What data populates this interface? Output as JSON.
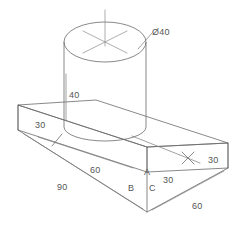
{
  "drawing": {
    "type": "isometric-technical-drawing",
    "subject": "rectangular base plate with cylindrical boss",
    "background_color": "#ffffff",
    "line_color": "#6b6b6b",
    "text_color": "#555555",
    "dimensions": [
      {
        "id": "diameter",
        "label": "Ø40",
        "value": 40,
        "symbol": "Ø",
        "x": 152,
        "y": 35,
        "anchor": "start",
        "describes": "cylinder diameter"
      },
      {
        "id": "cyl-height",
        "label": "40",
        "value": 40,
        "x": 69,
        "y": 98,
        "anchor": "start",
        "describes": "cylinder height"
      },
      {
        "id": "plate-thickness-left",
        "label": "30",
        "value": 30,
        "x": 35,
        "y": 128,
        "anchor": "start",
        "describes": "plate thickness left"
      },
      {
        "id": "boss-offset-left",
        "label": "60",
        "value": 60,
        "x": 90,
        "y": 173,
        "anchor": "start",
        "describes": "distance along 90 edge"
      },
      {
        "id": "plate-length",
        "label": "90",
        "value": 90,
        "x": 57,
        "y": 190,
        "anchor": "start",
        "describes": "plate length"
      },
      {
        "id": "plate-thickness-right",
        "label": "30",
        "value": 30,
        "x": 208,
        "y": 163,
        "anchor": "start",
        "describes": "plate thickness right"
      },
      {
        "id": "boss-offset-right",
        "label": "30",
        "value": 30,
        "x": 163,
        "y": 183,
        "anchor": "start",
        "describes": "offset from front corner"
      },
      {
        "id": "plate-width",
        "label": "60",
        "value": 60,
        "x": 192,
        "y": 209,
        "anchor": "start",
        "describes": "plate width"
      }
    ],
    "vertex_labels": [
      {
        "id": "vertex-a",
        "label": "A",
        "x": 144,
        "y": 175
      },
      {
        "id": "vertex-b",
        "label": "B",
        "x": 128,
        "y": 191
      },
      {
        "id": "vertex-c",
        "label": "C",
        "x": 149,
        "y": 191
      }
    ]
  }
}
